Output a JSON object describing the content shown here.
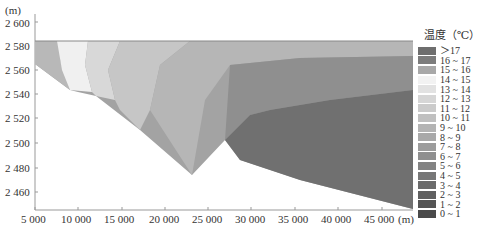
{
  "chart_data": {
    "type": "heatmap",
    "title": "",
    "ylabel": "(m)",
    "xlabel": "(m)",
    "y_ticks": [
      "2 600",
      "2 580",
      "2 560",
      "2 540",
      "2 520",
      "2 500",
      "2 480",
      "2 460"
    ],
    "x_ticks": [
      "5 000",
      "10 000",
      "15 000",
      "20 000",
      "25 000",
      "30 000",
      "35 000",
      "40 000",
      "45 000"
    ],
    "ylim": [
      2450,
      2605
    ],
    "xlim": [
      5000,
      47500
    ],
    "legend_title": "温度（℃）",
    "legend": [
      {
        "label": "＞17",
        "color": "#6e6e6e"
      },
      {
        "label": "16 ~ 17",
        "color": "#7c7c7c"
      },
      {
        "label": "15 ~ 16",
        "color": "#a8a8a8"
      },
      {
        "label": "14 ~ 15",
        "color": "#f2f2f2"
      },
      {
        "label": "13 ~ 14",
        "color": "#e2e2e2"
      },
      {
        "label": "12 ~ 13",
        "color": "#d6d6d6"
      },
      {
        "label": "11 ~ 12",
        "color": "#cbcbcb"
      },
      {
        "label": "10 ~ 11",
        "color": "#c0c0c0"
      },
      {
        "label": "9 ~ 10",
        "color": "#b4b4b4"
      },
      {
        "label": "8 ~ 9",
        "color": "#a9a9a9"
      },
      {
        "label": "7 ~ 8",
        "color": "#9c9c9c"
      },
      {
        "label": "6 ~ 7",
        "color": "#8f8f8f"
      },
      {
        "label": "5 ~ 6",
        "color": "#838383"
      },
      {
        "label": "4 ~ 5",
        "color": "#777777"
      },
      {
        "label": "3 ~ 4",
        "color": "#6b6b6b"
      },
      {
        "label": "2 ~ 3",
        "color": "#606060"
      },
      {
        "label": "1 ~ 2",
        "color": "#555555"
      },
      {
        "label": "0 ~ 1",
        "color": "#4a4a4a"
      }
    ]
  }
}
